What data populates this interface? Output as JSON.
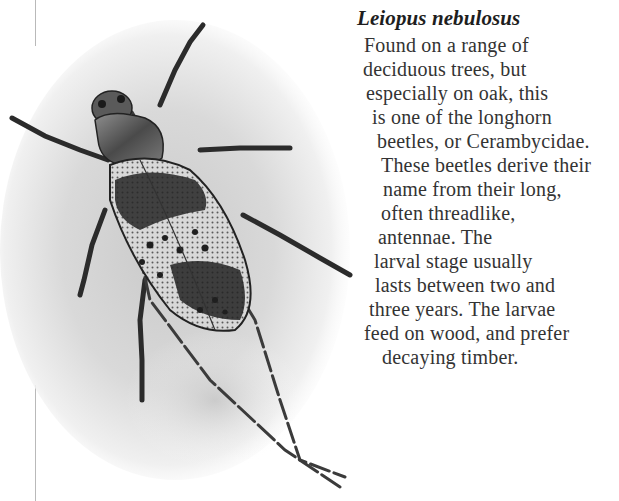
{
  "page": {
    "species_title": "Leiopus nebulosus",
    "body_lines": [
      "Found on a range of",
      "deciduous trees, but",
      "especially on oak, this",
      "is one of the longhorn",
      "beetles, or Cerambycidae.",
      "These beetles derive their",
      "name from their long,",
      "often threadlike,",
      "antennae. The",
      "larval stage usually",
      "lasts between two and",
      "three years. The larvae",
      "feed on wood, and prefer",
      "decaying timber."
    ],
    "illustration": {
      "subject": "longhorn-beetle-illustration",
      "caption_ref": "Leiopus nebulosus"
    }
  },
  "colors": {
    "paper": "#ffffff",
    "ink": "#333333",
    "title_ink": "#1e1e1e",
    "margin_rule": "#b9b9b9"
  }
}
